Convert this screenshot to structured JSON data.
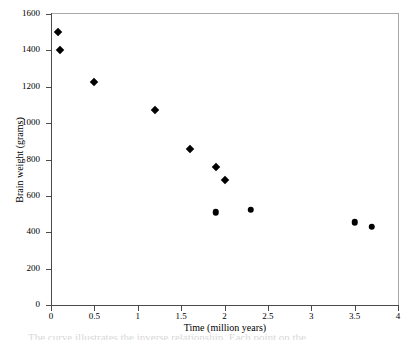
{
  "chart_data": {
    "type": "scatter",
    "title": "",
    "xlabel": "Time (million years)",
    "ylabel": "Brain weight (grams)",
    "xlim": [
      0,
      4
    ],
    "ylim": [
      0,
      1600
    ],
    "xticks": [
      0,
      0.5,
      1,
      1.5,
      2,
      2.5,
      3,
      3.5,
      4
    ],
    "xtick_labels": [
      "0",
      "0.5",
      "1",
      "1.5",
      "2",
      "2.5",
      "3",
      "3.5",
      "4"
    ],
    "yticks": [
      0,
      200,
      400,
      600,
      800,
      1000,
      1200,
      1400,
      1600
    ],
    "ytick_labels": [
      "0",
      "200",
      "400",
      "600",
      "800",
      "1000",
      "1200",
      "1400",
      "1600"
    ],
    "grid": false,
    "legend": null,
    "marker_color": "#000000",
    "series": [
      {
        "name": "diamond-markers",
        "marker": "diamond",
        "points": [
          {
            "x": 0.08,
            "y": 1500
          },
          {
            "x": 0.1,
            "y": 1400
          },
          {
            "x": 0.5,
            "y": 1225
          },
          {
            "x": 1.2,
            "y": 1070
          },
          {
            "x": 1.6,
            "y": 855
          },
          {
            "x": 1.9,
            "y": 760
          },
          {
            "x": 2.0,
            "y": 690
          }
        ]
      },
      {
        "name": "circle-markers",
        "marker": "circle",
        "points": [
          {
            "x": 1.9,
            "y": 510
          },
          {
            "x": 2.3,
            "y": 525
          },
          {
            "x": 3.5,
            "y": 455
          },
          {
            "x": 3.7,
            "y": 430
          }
        ]
      }
    ]
  },
  "caption": {
    "remnant_text": "The curve illustrates the inverse relationship. Each point on the"
  }
}
